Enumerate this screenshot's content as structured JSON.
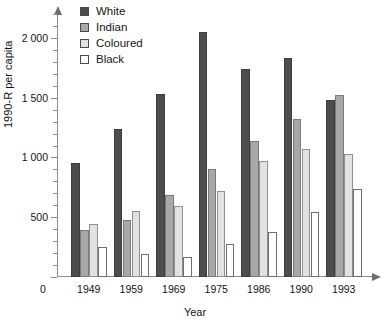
{
  "chart_data": {
    "type": "bar",
    "title": "",
    "xlabel": "Year",
    "ylabel": "1990-R per capita",
    "categories": [
      "1949",
      "1959",
      "1969",
      "1975",
      "1986",
      "1990",
      "1993"
    ],
    "series": [
      {
        "name": "White",
        "color": "#4d4d4d",
        "values": [
          950,
          1240,
          1530,
          2050,
          1740,
          1830,
          1480
        ]
      },
      {
        "name": "Indian",
        "color": "#a8a8a8",
        "values": [
          390,
          475,
          690,
          900,
          1140,
          1320,
          1520
        ]
      },
      {
        "name": "Coloured",
        "color": "#e2e2e2",
        "values": [
          440,
          555,
          590,
          720,
          970,
          1070,
          1030
        ]
      },
      {
        "name": "Black",
        "color": "#ffffff",
        "values": [
          250,
          195,
          165,
          280,
          380,
          540,
          740
        ]
      }
    ],
    "ylim": [
      0,
      2200
    ],
    "yticks": [
      0,
      500,
      1000,
      1500,
      2000
    ],
    "ytick_labels": [
      "0",
      "500",
      "1 000",
      "1 500",
      "2 000"
    ],
    "yminor_step": 100,
    "grid": false,
    "legend_position": "top-left-inside",
    "zero_label": "0"
  },
  "legend": {
    "items": [
      {
        "label": "White"
      },
      {
        "label": "Indian"
      },
      {
        "label": "Coloured"
      },
      {
        "label": "Black"
      }
    ]
  }
}
